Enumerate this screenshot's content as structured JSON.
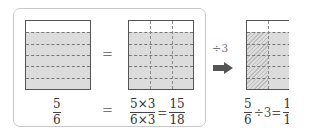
{
  "panel1": {
    "fraction": {
      "numerator": "5",
      "denominator": "6"
    },
    "parts_total": 6,
    "parts_shaded": 5
  },
  "equals": "=",
  "panel2": {
    "fraction": {
      "numerator": "5×3",
      "denominator": "6×3"
    },
    "result": {
      "numerator": "15",
      "denominator": "18"
    },
    "rows": 6,
    "columns": 3
  },
  "operation": {
    "label": "÷3",
    "icon": "right-arrow-icon"
  },
  "panel3": {
    "fraction": {
      "numerator": "5",
      "denominator": "6"
    },
    "operator": "÷3=",
    "result": {
      "numerator": "1",
      "denominator": "1"
    },
    "hatched_columns": 1
  },
  "colors": {
    "shade": "#dcdcdc",
    "border": "#555555",
    "frame": "#c8c8c8",
    "arrow": "#555555"
  }
}
